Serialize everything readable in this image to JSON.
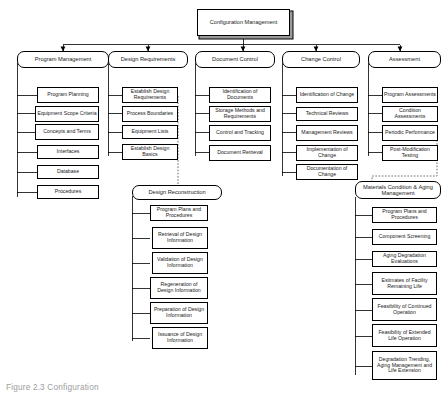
{
  "diagram": {
    "type": "org-tree",
    "title": "Configuration Management",
    "caption": "Figure 2.3  Configuration",
    "root": {
      "label": "Configuration Management"
    },
    "branches": [
      {
        "id": "program-management",
        "header": "Program Management",
        "items": [
          "Program Planning",
          "Equipment Scope Criteria",
          "Concepts and Terms",
          "Interfaces",
          "Database",
          "Procedures"
        ]
      },
      {
        "id": "design-requirements",
        "header": "Design  Requirements",
        "items": [
          "Establish Design Requirements",
          "Process Boundaries",
          "Equipment Lists",
          "Establish Design Basics"
        ]
      },
      {
        "id": "document-control",
        "header": "Document Control",
        "items": [
          "Identification of Documents",
          "Storage Methods and Requirements",
          "Control and Tracking",
          "Document Retrieval"
        ]
      },
      {
        "id": "change-control",
        "header": "Change Control",
        "items": [
          "Identification of Change",
          "Technical Reviews",
          "Management Reviews",
          "Implementation of Change",
          "Documentation of Change"
        ]
      },
      {
        "id": "assessment",
        "header": "Assessment",
        "items": [
          "Program Assessments",
          "Condition Assessments",
          "Periodic Performance",
          "Post-Modification Testing"
        ]
      }
    ],
    "sub_branches": [
      {
        "id": "design-reconstruction",
        "header": "Design Reconstruction",
        "linked_from": "design-requirements",
        "link_style": "dashed",
        "items": [
          "Program Plans and Procedures",
          "Retrieval of Design Information",
          "Validation of Design Information",
          "Regeneration of Design Information",
          "Preparation of Design Information",
          "Issuance of Design Information"
        ]
      },
      {
        "id": "materials-condition-aging-management",
        "header": "Materials Condition & Aging Management",
        "linked_from": "assessment",
        "link_style": "dashed",
        "items": [
          "Program Plans and Procedures",
          "Component Screening",
          "Aging Degradation Evaluations",
          "Estimates of Facility Remaining Life",
          "Feasibility of Continued Operation",
          "Feasibility of Extended Life Operation",
          "Degradation Trending, Aging Management and Life Extension"
        ]
      }
    ],
    "colors": {
      "line": "#000000",
      "box_fill": "#ffffff",
      "shadow": "#8e8e8e",
      "caption": "#9d9d9d"
    }
  }
}
